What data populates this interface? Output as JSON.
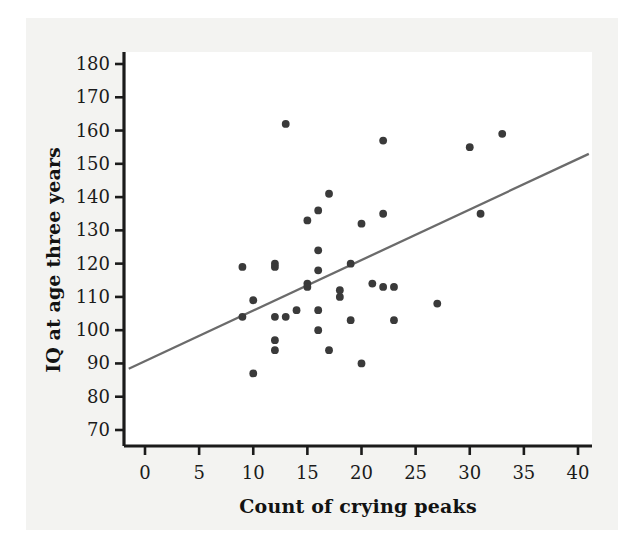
{
  "chart_data": {
    "type": "scatter",
    "title": "",
    "xlabel": "Count of crying peaks",
    "ylabel": "IQ at age three years",
    "xlim": [
      -1.5,
      42
    ],
    "ylim": [
      65.5,
      183
    ],
    "xticks": [
      0,
      5,
      10,
      15,
      20,
      25,
      30,
      35,
      40
    ],
    "yticks": [
      70,
      80,
      90,
      100,
      110,
      120,
      130,
      140,
      150,
      160,
      170,
      180
    ],
    "grid": false,
    "legend": null,
    "point_color": "#3a3a3a",
    "line_color": "#6b6b6b",
    "axis_color": "#1b1b1b",
    "series": [
      {
        "name": "Infants",
        "points": [
          [
            9,
            119
          ],
          [
            9,
            104
          ],
          [
            10,
            109
          ],
          [
            10,
            87
          ],
          [
            12,
            120
          ],
          [
            12,
            119
          ],
          [
            12,
            104
          ],
          [
            12,
            97
          ],
          [
            12,
            94
          ],
          [
            13,
            162
          ],
          [
            13,
            104
          ],
          [
            14,
            106
          ],
          [
            15,
            133
          ],
          [
            15,
            114
          ],
          [
            15,
            113
          ],
          [
            16,
            136
          ],
          [
            16,
            124
          ],
          [
            16,
            118
          ],
          [
            16,
            106
          ],
          [
            16,
            100
          ],
          [
            17,
            141
          ],
          [
            17,
            94
          ],
          [
            18,
            112
          ],
          [
            18,
            110
          ],
          [
            19,
            120
          ],
          [
            19,
            103
          ],
          [
            20,
            132
          ],
          [
            20,
            90
          ],
          [
            21,
            114
          ],
          [
            22,
            157
          ],
          [
            22,
            135
          ],
          [
            22,
            113
          ],
          [
            23,
            113
          ],
          [
            23,
            103
          ],
          [
            27,
            108
          ],
          [
            30,
            155
          ],
          [
            31,
            135
          ],
          [
            33,
            159
          ]
        ]
      }
    ],
    "trend_line": {
      "name": "regression-line",
      "x_start": -1.5,
      "y_start": 88.4,
      "x_end": 41.0,
      "y_end": 153.0
    }
  },
  "axis": {
    "x_tick_labels": [
      "0",
      "5",
      "10",
      "15",
      "20",
      "25",
      "30",
      "35",
      "40"
    ],
    "y_tick_labels": [
      "70",
      "80",
      "90",
      "100",
      "110",
      "120",
      "130",
      "140",
      "150",
      "160",
      "170",
      "180"
    ],
    "x_title": "Count of crying peaks",
    "y_title": "IQ at age three years"
  }
}
